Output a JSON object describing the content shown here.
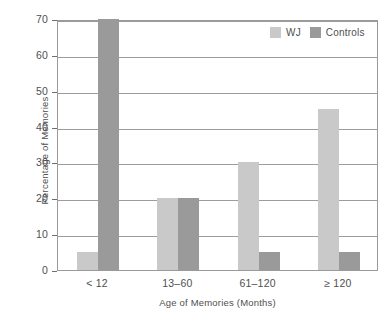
{
  "chart_data": {
    "type": "bar",
    "title": "",
    "subtitle": "",
    "xlabel": "Age of Memories (Months)",
    "ylabel": "Percentage of Memories",
    "categories": [
      "< 12",
      "13–60",
      "61–120",
      "≥ 120"
    ],
    "series": [
      {
        "name": "WJ",
        "values": [
          5,
          20,
          30,
          45
        ],
        "color": "#c9c9c9"
      },
      {
        "name": "Controls",
        "values": [
          70,
          20,
          5,
          5
        ],
        "color": "#9a9a9a"
      }
    ],
    "ylim": [
      0,
      70
    ],
    "yticks": [
      0,
      10,
      20,
      30,
      40,
      50,
      60,
      70
    ],
    "ytick_labels": [
      "0",
      "10",
      "20",
      "30",
      "40",
      "50",
      "60",
      "70"
    ],
    "grid": true,
    "grid_axis": "y",
    "legend_position": "top-right"
  },
  "axes": {
    "y_title": "Percentage of Memories",
    "x_title": "Age of Memories (Months)",
    "y_ticks": [
      "70",
      "60",
      "50",
      "40",
      "30",
      "20",
      "10",
      "0"
    ],
    "x_ticks": [
      "< 12",
      "13–60",
      "61–120",
      "≥ 120"
    ]
  },
  "legend": {
    "items": [
      {
        "label": "WJ",
        "color": "#c9c9c9"
      },
      {
        "label": "Controls",
        "color": "#9a9a9a"
      }
    ]
  },
  "colors": {
    "wj": "#c9c9c9",
    "controls": "#9a9a9a",
    "gridline": "#9c9c9c",
    "axis": "#8f8f8f",
    "text": "#4f4f4f",
    "background": "#ffffff"
  }
}
